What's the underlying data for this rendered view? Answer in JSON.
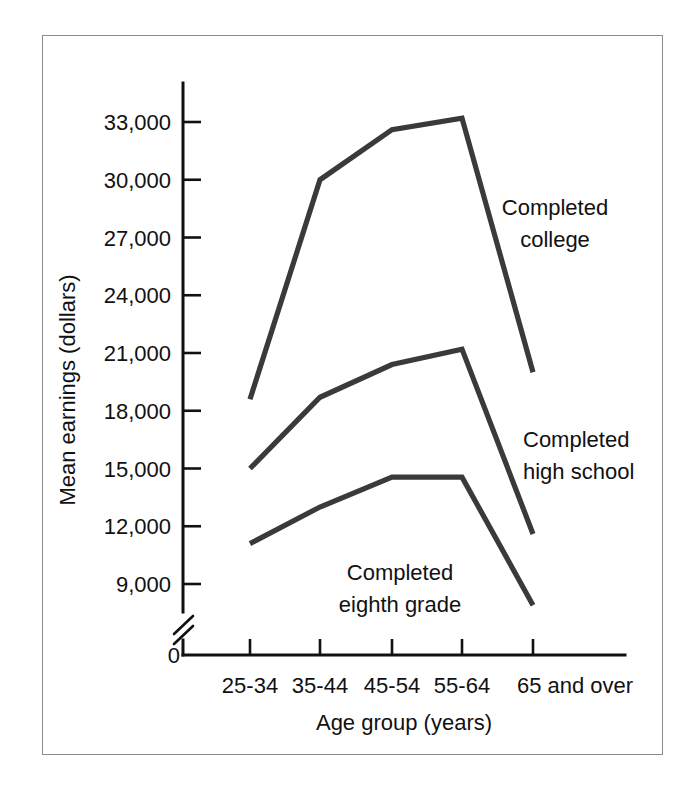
{
  "chart_data": {
    "type": "line",
    "title": "",
    "xlabel": "Age group (years)",
    "ylabel": "Mean earnings (dollars)",
    "categories": [
      "25-34",
      "35-44",
      "45-54",
      "55-64",
      "65 and over"
    ],
    "ylim": [
      9000,
      34500
    ],
    "yticks": [
      9000,
      12000,
      15000,
      18000,
      21000,
      24000,
      27000,
      30000,
      33000
    ],
    "ytick_labels": [
      "9,000",
      "12,000",
      "15,000",
      "18,000",
      "21,000",
      "24,000",
      "27,000",
      "30,000",
      "33,000"
    ],
    "y_origin_label": "0",
    "axis_break": true,
    "grid": false,
    "legend_position": "inline-annotations",
    "series": [
      {
        "name": "Completed college",
        "label": "Completed\ncollege",
        "label_line1": "Completed",
        "label_line2": "college",
        "values": [
          18600,
          30000,
          32600,
          33200,
          20000
        ]
      },
      {
        "name": "Completed high school",
        "label": "Completed\nhigh school",
        "label_line1": "Completed",
        "label_line2": "high school",
        "values": [
          15000,
          18700,
          20400,
          21200,
          11600
        ]
      },
      {
        "name": "Completed eighth grade",
        "label": "Completed\neighth grade",
        "label_line1": "Completed",
        "label_line2": "eighth grade",
        "values": [
          11100,
          13000,
          14550,
          14550,
          7900
        ]
      }
    ],
    "colors": {
      "line": "#3a3a3a",
      "axis": "#111111",
      "frame": "#8b8b8b",
      "background": "#ffffff"
    }
  },
  "annotations": {
    "college": {
      "x": 555,
      "y_line1": 215,
      "y_line2": 247,
      "anchor": "middle"
    },
    "high_school": {
      "x": 523,
      "y_line1": 447,
      "y_line2": 479,
      "anchor": "start"
    },
    "eighth_grade": {
      "x": 400,
      "y_line1": 580,
      "y_line2": 612,
      "anchor": "middle"
    }
  },
  "geometry": {
    "axis_x": 183,
    "axis_top": 83,
    "axis_bottom": 655,
    "axis_right": 625,
    "y_9000_px": 584,
    "y_33000_px": 122,
    "x_ticks_px": [
      250,
      320,
      392,
      462,
      533
    ],
    "origin_label_x": 166,
    "origin_label_y": 663
  }
}
